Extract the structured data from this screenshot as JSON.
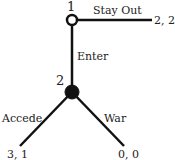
{
  "game_tree": {
    "type": "extensive-form game",
    "nodes": [
      {
        "id": "n1",
        "player_label": "1",
        "style": "open"
      },
      {
        "id": "n2",
        "player_label": "2",
        "style": "filled"
      }
    ],
    "branches": [
      {
        "id": "stay-out",
        "label": "Stay Out",
        "from": "n1",
        "payoff": "2, 2"
      },
      {
        "id": "enter",
        "label": "Enter",
        "from": "n1",
        "to": "n2"
      },
      {
        "id": "accede",
        "label": "Accede",
        "from": "n2",
        "payoff": "3, 1"
      },
      {
        "id": "war",
        "label": "War",
        "from": "n2",
        "payoff": "0, 0"
      }
    ],
    "colors": {
      "line": "#111111",
      "text": "#222222",
      "background": "#ffffff"
    }
  }
}
